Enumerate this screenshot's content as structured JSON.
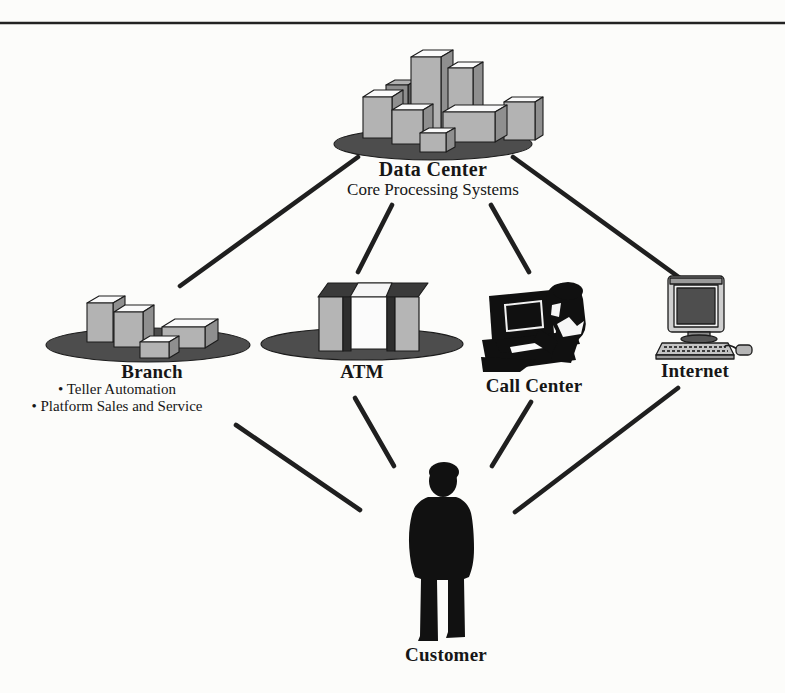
{
  "page": {
    "background": "#fcfcfa",
    "ink": "#1c1c1c"
  },
  "diagram": {
    "nodes": {
      "data_center": {
        "label": "Data Center",
        "sublabel": "Core Processing Systems",
        "icon": "server-buildings-cluster-icon"
      },
      "branch": {
        "label": "Branch",
        "bullets": [
          "• Teller Automation",
          "• Platform Sales and Service"
        ],
        "icon": "branch-buildings-icon"
      },
      "atm": {
        "label": "ATM",
        "icon": "atm-machine-icon"
      },
      "call_center": {
        "label": "Call Center",
        "icon": "call-center-agent-icon"
      },
      "internet": {
        "label": "Internet",
        "icon": "desktop-computer-icon"
      },
      "customer": {
        "label": "Customer",
        "icon": "person-silhouette-icon"
      }
    },
    "edges": [
      {
        "from": "Data Center",
        "to": "Branch"
      },
      {
        "from": "Data Center",
        "to": "ATM"
      },
      {
        "from": "Data Center",
        "to": "Call Center"
      },
      {
        "from": "Data Center",
        "to": "Internet"
      },
      {
        "from": "Branch",
        "to": "Customer"
      },
      {
        "from": "ATM",
        "to": "Customer"
      },
      {
        "from": "Call Center",
        "to": "Customer"
      },
      {
        "from": "Internet",
        "to": "Customer"
      }
    ],
    "colors": {
      "platform_ellipse": "#4d4d4d",
      "box_front": "#b3b3b3",
      "box_side": "#8f8f8f",
      "box_top": "#fafafa",
      "silhouette": "#111111",
      "line": "#1f1f1f"
    }
  }
}
